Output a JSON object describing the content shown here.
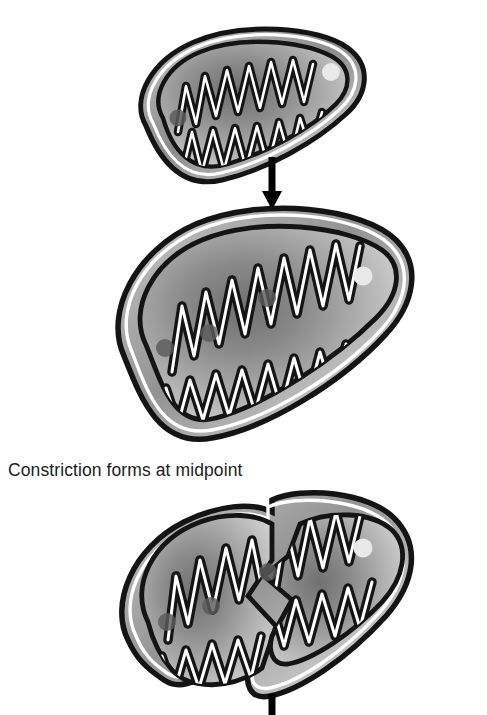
{
  "figure": {
    "background_color": "#ffffff",
    "width": 487,
    "height": 715
  },
  "palette": {
    "outline_black": "#141414",
    "membrane_white": "#ffffff",
    "matrix_light": "#d8d8d8",
    "matrix_mid": "#ababab",
    "matrix_dark": "#6f6f6f",
    "intermembrane_gray": "#b9b9b9",
    "granule_light": "#e9e9e9",
    "nucleoid_dark": "#5c5c5c",
    "arrow_black": "#000000",
    "caption_color": "#1b1b1b"
  },
  "captions": [
    {
      "id": "constriction-caption",
      "text": "Constriction forms at midpoint",
      "x": 8,
      "y": 459
    }
  ],
  "stages": [
    {
      "id": "stage-1-intact-mitochondrion",
      "label": "Intact mitochondrion",
      "order": 1,
      "bbox": {
        "x": 138,
        "y": 33,
        "width": 218,
        "height": 150
      },
      "granules_light": 1,
      "nucleoids_dark": 1,
      "cristae_count": 13
    },
    {
      "id": "stage-2-enlarged-mitochondrion",
      "label": "Enlarged mitochondrion",
      "order": 2,
      "bbox": {
        "x": 110,
        "y": 213,
        "width": 296,
        "height": 228
      },
      "granules_light": 1,
      "nucleoids_dark": 3,
      "cristae_count": 15
    },
    {
      "id": "stage-3-constricted-mitochondrion",
      "label": "Constricted mitochondrion",
      "order": 3,
      "bbox": {
        "x": 112,
        "y": 497,
        "width": 296,
        "height": 218
      },
      "granules_light": 1,
      "nucleoids_dark": 3,
      "cristae_count": 15,
      "constriction": "midpoint notch, top and bottom"
    }
  ],
  "arrows": [
    {
      "id": "arrow-stage1-to-stage2",
      "direction": "down",
      "x": 272,
      "y_start": 157,
      "y_end": 209,
      "shaft_width": 7,
      "head_width": 19,
      "head_height": 17
    },
    {
      "id": "arrow-stage3-to-next",
      "direction": "down",
      "x": 272,
      "y_start": 694,
      "y_end": 715,
      "shaft_width": 7,
      "clipped": "true"
    }
  ]
}
